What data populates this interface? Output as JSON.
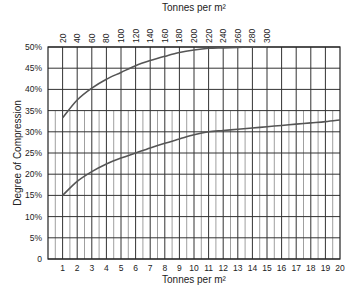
{
  "chart_data": {
    "type": "line",
    "title": "",
    "xlabel": "Tonnes per m²",
    "xlabel_top": "Tonnes per m²",
    "ylabel": "Degree of Compression",
    "xlim": [
      0,
      20
    ],
    "xlim_top": [
      0,
      400
    ],
    "ylim": [
      0,
      50
    ],
    "grid": true,
    "legend": "none",
    "x_ticks": [
      1,
      2,
      3,
      4,
      5,
      6,
      7,
      8,
      9,
      10,
      11,
      12,
      13,
      14,
      15,
      16,
      17,
      18,
      19,
      20
    ],
    "x_tick_labels": [
      "1",
      "2",
      "3",
      "4",
      "5",
      "6",
      "7",
      "8",
      "9",
      "10",
      "11",
      "12",
      "13",
      "14",
      "15",
      "16",
      "17",
      "18",
      "19",
      "20"
    ],
    "x_top_ticks": [
      20,
      40,
      60,
      80,
      100,
      120,
      140,
      160,
      180,
      200,
      220,
      240,
      260,
      280,
      300
    ],
    "x_top_tick_labels": [
      "20",
      "40",
      "60",
      "80",
      "100",
      "120",
      "140",
      "160",
      "180",
      "200",
      "220",
      "240",
      "260",
      "280",
      "300"
    ],
    "y_ticks": [
      0,
      5,
      10,
      15,
      20,
      25,
      30,
      35,
      40,
      45,
      50
    ],
    "y_tick_labels": [
      "0",
      "5%",
      "10%",
      "15%",
      "20%",
      "25%",
      "30%",
      "35%",
      "40%",
      "45%",
      "50%"
    ],
    "series": [
      {
        "name": "upper curve (top axis, tonnes per m²)",
        "axis": "top",
        "x": [
          20,
          40,
          60,
          80,
          100,
          120,
          140,
          160,
          180,
          200,
          220,
          240,
          260,
          280,
          300
        ],
        "y": [
          33.3,
          37.5,
          40.3,
          42.4,
          44.0,
          45.6,
          46.8,
          47.8,
          48.7,
          49.3,
          49.7,
          49.8,
          49.9,
          50.0,
          50.0
        ]
      },
      {
        "name": "lower curve (bottom axis, tonnes per m²)",
        "axis": "bottom",
        "x": [
          1,
          2,
          3,
          4,
          5,
          6,
          7,
          8,
          9,
          10,
          11,
          12,
          13,
          14,
          15,
          16,
          17,
          18,
          19,
          20
        ],
        "y": [
          15.0,
          18.3,
          20.6,
          22.4,
          23.8,
          25.0,
          26.2,
          27.3,
          28.3,
          29.3,
          30.0,
          30.3,
          30.6,
          30.9,
          31.2,
          31.5,
          31.8,
          32.1,
          32.4,
          32.8
        ]
      }
    ],
    "line_color": "#555555",
    "grid_color": "#333333"
  }
}
